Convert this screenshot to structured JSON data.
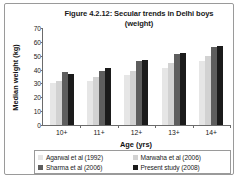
{
  "figure": {
    "title_line1": "Figure 4.2.12: Secular trends in Delhi boys",
    "title_line2": "(weight)"
  },
  "chart_data": {
    "type": "bar",
    "title": "Figure 4.2.12: Secular trends in Delhi boys (weight)",
    "xlabel": "Age (yrs)",
    "ylabel": "Median weight (kg)",
    "categories": [
      "10+",
      "11+",
      "12+",
      "13+",
      "14+"
    ],
    "ylim": [
      0,
      70
    ],
    "yticks": [
      0,
      10,
      20,
      30,
      40,
      50,
      60,
      70
    ],
    "grid": false,
    "legend_position": "bottom",
    "series": [
      {
        "name": "Agarwal et al (1992)",
        "color": "#e6e6e6",
        "values": [
          30,
          32,
          36,
          41,
          46
        ]
      },
      {
        "name": "Marwaha et al (2006)",
        "color": "#d2d2d2",
        "values": [
          32,
          35,
          39,
          45,
          50
        ]
      },
      {
        "name": "Sharma et al (2006)",
        "color": "#5e5e5e",
        "values": [
          38,
          39,
          46,
          51,
          56
        ]
      },
      {
        "name": "Present study (2008)",
        "color": "#1b1b1b",
        "values": [
          37,
          41,
          47,
          52,
          57
        ]
      }
    ]
  }
}
